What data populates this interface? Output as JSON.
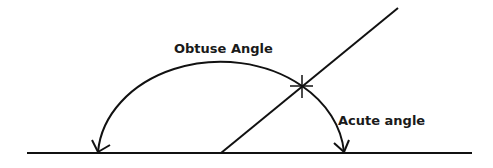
{
  "diagram": {
    "labels": {
      "obtuse": "Obtuse Angle",
      "acute": "Acute angle"
    },
    "colors": {
      "stroke": "#111111",
      "background": "#ffffff"
    }
  }
}
